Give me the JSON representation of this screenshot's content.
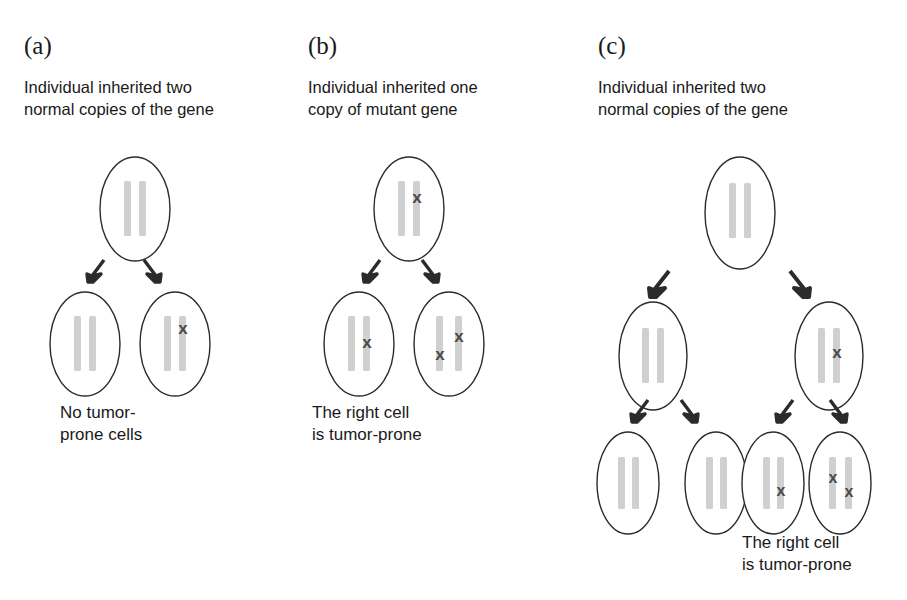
{
  "figure": {
    "background_color": "#ffffff",
    "chromosome_color": "#d0d0d0",
    "cell_outline_color": "#2b2b2b",
    "mutation_mark_color": "#4a4a4a",
    "arrow_color": "#2b2b2b",
    "mutation_glyph": "x"
  },
  "panels": [
    {
      "id": "a",
      "label": "(a)",
      "caption_top": "Individual inherited two\nnormal copies of the gene",
      "caption_bottom": "No tumor-\nprone cells",
      "generations": [
        {
          "cells": [
            {
              "name": "parent-cell",
              "mutations": []
            }
          ]
        },
        {
          "cells": [
            {
              "name": "daughter-cell-left",
              "mutations": []
            },
            {
              "name": "daughter-cell-right",
              "mutations": [
                "right-upper"
              ]
            }
          ]
        }
      ]
    },
    {
      "id": "b",
      "label": "(b)",
      "caption_top": "Individual inherited one\ncopy of mutant gene",
      "caption_bottom": "The right cell\nis tumor-prone",
      "generations": [
        {
          "cells": [
            {
              "name": "parent-cell",
              "mutations": [
                "right-upper"
              ]
            }
          ]
        },
        {
          "cells": [
            {
              "name": "daughter-cell-left",
              "mutations": [
                "right-middle"
              ]
            },
            {
              "name": "daughter-cell-right",
              "mutations": [
                "right-upper",
                "left-lower"
              ]
            }
          ]
        }
      ]
    },
    {
      "id": "c",
      "label": "(c)",
      "caption_top": "Individual inherited two\nnormal copies of the gene",
      "caption_bottom": "The right cell\nis tumor-prone",
      "generations": [
        {
          "cells": [
            {
              "name": "parent-cell",
              "mutations": []
            }
          ]
        },
        {
          "cells": [
            {
              "name": "daughter-cell-left",
              "mutations": []
            },
            {
              "name": "daughter-cell-right",
              "mutations": [
                "right-middle"
              ]
            }
          ]
        },
        {
          "cells": [
            {
              "name": "granddaughter-cell-1",
              "mutations": []
            },
            {
              "name": "granddaughter-cell-2",
              "mutations": []
            },
            {
              "name": "granddaughter-cell-3",
              "mutations": [
                "right-lower"
              ]
            },
            {
              "name": "granddaughter-cell-4",
              "mutations": [
                "left-upper",
                "right-lower"
              ]
            }
          ]
        }
      ]
    }
  ]
}
